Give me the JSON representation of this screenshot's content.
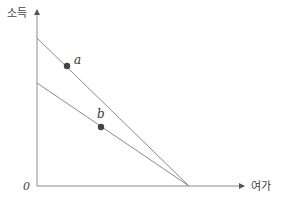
{
  "diagram": {
    "y_axis_label": "소득",
    "x_axis_label": "여가",
    "origin_label": "0",
    "colors": {
      "axis": "#8a8a8a",
      "line": "#8a8a8a",
      "point": "#444444",
      "text": "#444444"
    },
    "lines": [
      {
        "name": "upper-budget-line",
        "x1": 37,
        "y1": 38,
        "x2": 189,
        "y2": 186
      },
      {
        "name": "lower-budget-line",
        "x1": 37,
        "y1": 83,
        "x2": 189,
        "y2": 186
      }
    ],
    "points": [
      {
        "label": "a",
        "cx": 67,
        "cy": 66,
        "label_x": 74,
        "label_y": 64
      },
      {
        "label": "b",
        "cx": 101,
        "cy": 127,
        "label_x": 97,
        "label_y": 118
      }
    ]
  }
}
